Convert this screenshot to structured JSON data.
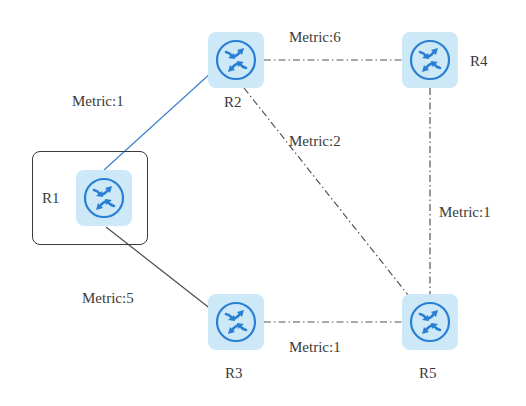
{
  "diagram": {
    "type": "network-topology",
    "colors": {
      "router_tile": "#cde9f8",
      "router_stroke": "#2a7fd4",
      "link_solid_blue": "#3d7fd0",
      "link_solid_gray": "#4a4a4a",
      "link_dashdot": "#555555",
      "text": "#3a3a3a"
    },
    "nodes": [
      {
        "id": "R1",
        "label": "R1",
        "icon": "router-icon",
        "highlighted": true
      },
      {
        "id": "R2",
        "label": "R2",
        "icon": "router-icon"
      },
      {
        "id": "R3",
        "label": "R3",
        "icon": "router-icon"
      },
      {
        "id": "R4",
        "label": "R4",
        "icon": "router-icon"
      },
      {
        "id": "R5",
        "label": "R5",
        "icon": "router-icon"
      }
    ],
    "links": [
      {
        "from": "R1",
        "to": "R2",
        "label": "Metric:1",
        "style": "solid-blue"
      },
      {
        "from": "R1",
        "to": "R3",
        "label": "Metric:5",
        "style": "solid-gray"
      },
      {
        "from": "R2",
        "to": "R4",
        "label": "Metric:6",
        "style": "dash-dot"
      },
      {
        "from": "R2",
        "to": "R5",
        "label": "Metric:2",
        "style": "dash-dot"
      },
      {
        "from": "R4",
        "to": "R5",
        "label": "Metric:1",
        "style": "dash-dot"
      },
      {
        "from": "R3",
        "to": "R5",
        "label": "Metric:1",
        "style": "dash-dot"
      }
    ]
  }
}
